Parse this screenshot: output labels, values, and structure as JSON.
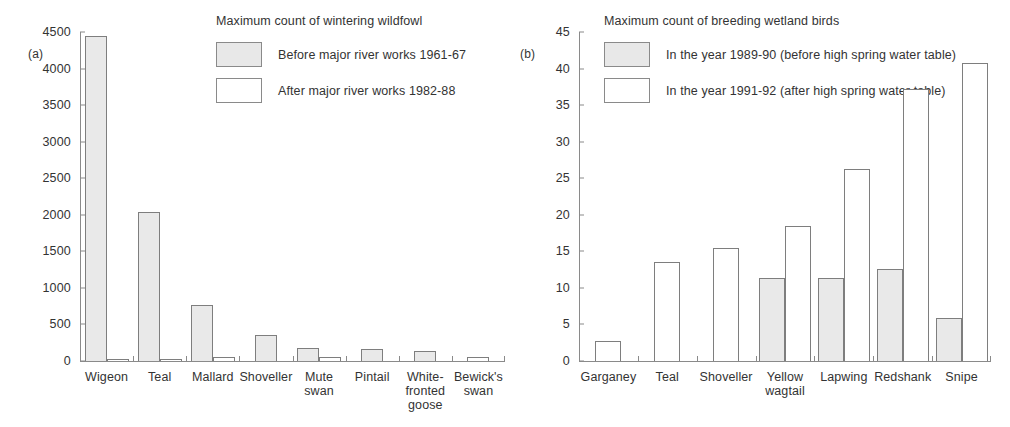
{
  "figure": {
    "panel_a_letter": "(a)",
    "panel_b_letter": "(b)"
  },
  "chart_data": [
    {
      "type": "bar",
      "panel": "(a)",
      "title": "Maximum count of wintering wildfowl",
      "xlabel": "",
      "ylabel": "",
      "ylim": [
        0,
        4500
      ],
      "yticks": [
        0,
        500,
        1000,
        1500,
        2000,
        2500,
        3000,
        3500,
        4000,
        4500
      ],
      "grid": false,
      "legend_position": "top-right",
      "categories": [
        "Wigeon",
        "Teal",
        "Mallard",
        "Shoveller",
        "Mute swan",
        "Pintail",
        "White-fronted goose",
        "Bewick's swan"
      ],
      "category_lines": [
        [
          "Wigeon"
        ],
        [
          "Teal"
        ],
        [
          "Mallard"
        ],
        [
          "Shoveller"
        ],
        [
          "Mute",
          "swan"
        ],
        [
          "Pintail"
        ],
        [
          "White-",
          "fronted",
          "goose"
        ],
        [
          "Bewick's",
          "swan"
        ]
      ],
      "series": [
        {
          "name": "Before major river works 1961-67",
          "style": "filled",
          "color": "#e9e9e9",
          "values": [
            4440,
            2040,
            770,
            360,
            175,
            170,
            140,
            0
          ]
        },
        {
          "name": "After major river works 1982-88",
          "style": "empty",
          "color": "#ffffff",
          "values": [
            30,
            25,
            60,
            0,
            50,
            0,
            0,
            55
          ]
        }
      ]
    },
    {
      "type": "bar",
      "panel": "(b)",
      "title": "Maximum count of breeding wetland birds",
      "xlabel": "",
      "ylabel": "",
      "ylim": [
        0,
        45
      ],
      "yticks": [
        0,
        5,
        10,
        15,
        20,
        25,
        30,
        35,
        40,
        45
      ],
      "grid": false,
      "legend_position": "top-right",
      "categories": [
        "Garganey",
        "Teal",
        "Shoveller",
        "Yellow wagtail",
        "Lapwing",
        "Redshank",
        "Snipe"
      ],
      "category_lines": [
        [
          "Garganey"
        ],
        [
          "Teal"
        ],
        [
          "Shoveller"
        ],
        [
          "Yellow",
          "wagtail"
        ],
        [
          "Lapwing"
        ],
        [
          "Redshank"
        ],
        [
          "Snipe"
        ]
      ],
      "series": [
        {
          "name": "In the year 1989-90 (before high spring water table)",
          "style": "filled",
          "color": "#e9e9e9",
          "values": [
            0,
            0,
            0,
            11.4,
            11.3,
            12.6,
            5.9
          ]
        },
        {
          "name": "In the year 1991-92 (after high spring water table)",
          "style": "empty",
          "color": "#ffffff",
          "values": [
            2.8,
            13.5,
            15.4,
            18.4,
            26.2,
            37.2,
            40.8
          ]
        }
      ]
    }
  ]
}
